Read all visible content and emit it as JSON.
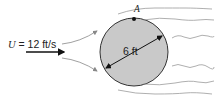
{
  "figure": {
    "velocity_symbol": "U",
    "velocity_rest": " = 12 ft/s",
    "point_label": "A",
    "diameter_label": "6 ft"
  },
  "colors": {
    "sphere_fill": "#c9c9c9",
    "sphere_stroke": "#333333",
    "streamline": "#9a9a9a",
    "arrow": "#111111"
  }
}
